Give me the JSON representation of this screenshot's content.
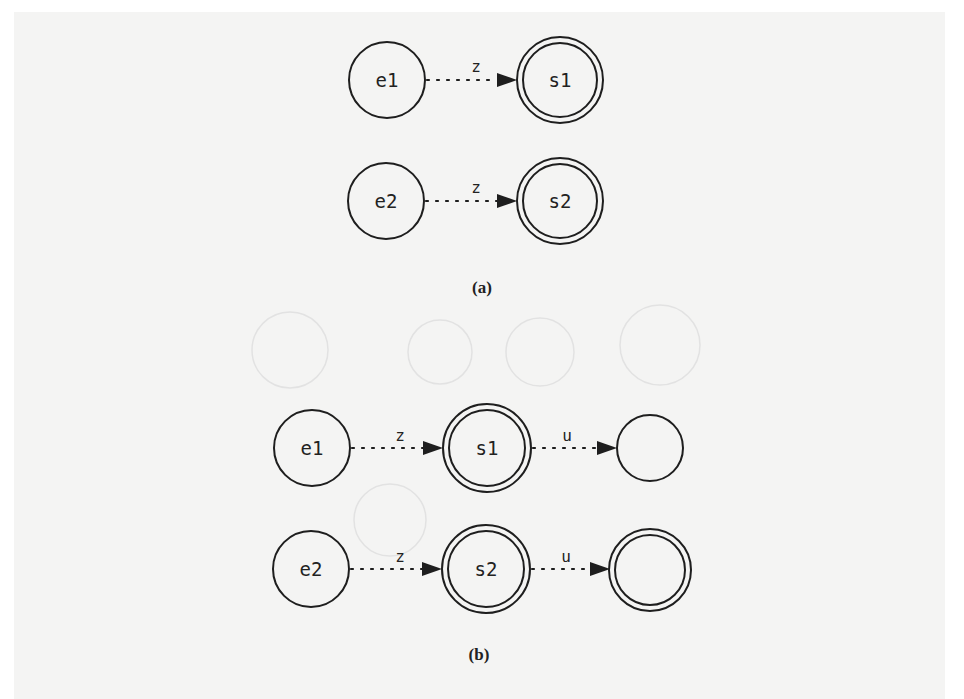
{
  "figure": {
    "panel_a": {
      "caption": "(a)",
      "nodes": [
        {
          "id": "e1",
          "label": "e1",
          "type": "state"
        },
        {
          "id": "s1",
          "label": "s1",
          "type": "accepting"
        },
        {
          "id": "e2",
          "label": "e2",
          "type": "state"
        },
        {
          "id": "s2",
          "label": "s2",
          "type": "accepting"
        }
      ],
      "edges": [
        {
          "from": "e1",
          "to": "s1",
          "label": "z",
          "style": "dotted"
        },
        {
          "from": "e2",
          "to": "s2",
          "label": "z",
          "style": "dotted"
        }
      ]
    },
    "panel_b": {
      "caption": "(b)",
      "nodes": [
        {
          "id": "e1",
          "label": "e1",
          "type": "state"
        },
        {
          "id": "s1",
          "label": "s1",
          "type": "accepting"
        },
        {
          "id": "n1",
          "label": "",
          "type": "state"
        },
        {
          "id": "e2",
          "label": "e2",
          "type": "state"
        },
        {
          "id": "s2",
          "label": "s2",
          "type": "accepting"
        },
        {
          "id": "n2",
          "label": "",
          "type": "accepting"
        }
      ],
      "edges": [
        {
          "from": "e1",
          "to": "s1",
          "label": "z",
          "style": "dotted"
        },
        {
          "from": "s1",
          "to": "n1",
          "label": "u",
          "style": "dotted"
        },
        {
          "from": "e2",
          "to": "s2",
          "label": "z",
          "style": "dotted"
        },
        {
          "from": "s2",
          "to": "n2",
          "label": "u",
          "style": "dotted"
        }
      ]
    }
  },
  "colors": {
    "paper": "#f4f4f3",
    "ink": "#1e1e1e"
  }
}
